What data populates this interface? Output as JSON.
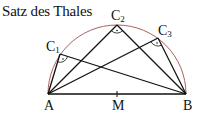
{
  "title": "Satz des Thales",
  "colors": {
    "arc": "#a0504a",
    "lines": "#111111",
    "background": "#ffffff"
  },
  "points": {
    "A": {
      "label": "A",
      "x": 48,
      "y": 94
    },
    "B": {
      "label": "B",
      "x": 186,
      "y": 94
    },
    "M": {
      "label": "M",
      "x": 117,
      "y": 94
    },
    "C1": {
      "label": "C",
      "sub": "1",
      "x": 60,
      "y": 54
    },
    "C2": {
      "label": "C",
      "sub": "2",
      "x": 117,
      "y": 25
    },
    "C3": {
      "label": "C",
      "sub": "3",
      "x": 158,
      "y": 38
    }
  }
}
